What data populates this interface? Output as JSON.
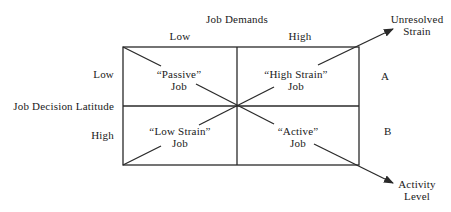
{
  "axes": {
    "x_title": "Job Demands",
    "x_low": "Low",
    "x_high": "High",
    "y_title": "Job Decision Latitude",
    "y_low": "Low",
    "y_high": "High"
  },
  "quadrants": {
    "top_left": {
      "line1": "“Passive”",
      "line2": "Job"
    },
    "top_right": {
      "line1": "“High Strain”",
      "line2": "Job"
    },
    "bottom_left": {
      "line1": "“Low Strain”",
      "line2": "Job"
    },
    "bottom_right": {
      "line1": "“Active”",
      "line2": "Job"
    }
  },
  "diagonals": {
    "A": {
      "label": "A",
      "outcome_line1": "Unresolved",
      "outcome_line2": "Strain"
    },
    "B": {
      "label": "B",
      "outcome_line1": "Activity",
      "outcome_line2": "Level"
    }
  },
  "colors": {
    "line": "#2a2a2a",
    "text": "#1a1a1a",
    "background": "#ffffff"
  }
}
